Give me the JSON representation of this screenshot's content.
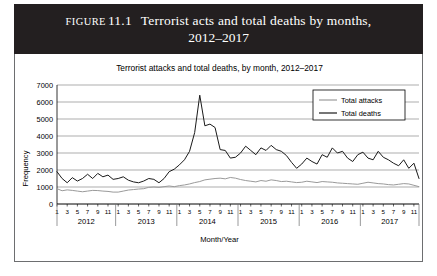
{
  "figure": {
    "label_word": "Figure",
    "number": "11.1",
    "title_line1": "Terrorist acts and total deaths by months,",
    "title_line2": "2012–2017",
    "banner_color": "#231f20",
    "banner_text_color": "#ffffff"
  },
  "chart_data": {
    "type": "line",
    "title": "Terrorist attacks and total deaths, by month, 2012–2017",
    "xlabel": "Month/Year",
    "ylabel": "Frequency",
    "ylim": [
      0,
      7000
    ],
    "ytick_step": 1000,
    "yticks": [
      "0",
      "1000",
      "2000",
      "3000",
      "4000",
      "5000",
      "6000",
      "7000"
    ],
    "grid": true,
    "legend_position": "top-right",
    "years": [
      "2012",
      "2013",
      "2014",
      "2015",
      "2016",
      "2017"
    ],
    "month_ticks": [
      "1",
      "3",
      "5",
      "7",
      "9",
      "11"
    ],
    "x_count": 72,
    "colors": {
      "total_attacks": "#9a9a9a",
      "total_deaths": "#1a1a1a"
    },
    "series": [
      {
        "name": "Total attacks",
        "color": "#9a9a9a",
        "values": [
          900,
          780,
          830,
          800,
          760,
          720,
          760,
          800,
          790,
          760,
          740,
          700,
          700,
          760,
          820,
          850,
          880,
          900,
          980,
          1000,
          980,
          1020,
          1060,
          1020,
          1080,
          1120,
          1180,
          1260,
          1320,
          1420,
          1460,
          1500,
          1520,
          1480,
          1560,
          1520,
          1440,
          1380,
          1340,
          1300,
          1380,
          1340,
          1420,
          1380,
          1320,
          1340,
          1300,
          1260,
          1280,
          1340,
          1300,
          1260,
          1320,
          1300,
          1280,
          1240,
          1220,
          1200,
          1180,
          1160,
          1220,
          1280,
          1240,
          1200,
          1180,
          1140,
          1120,
          1160,
          1200,
          1180,
          1100,
          1020
        ]
      },
      {
        "name": "Total deaths",
        "color": "#1a1a1a",
        "values": [
          1900,
          1500,
          1250,
          1550,
          1350,
          1500,
          1750,
          1500,
          1800,
          1600,
          1700,
          1450,
          1500,
          1600,
          1400,
          1300,
          1250,
          1350,
          1500,
          1450,
          1250,
          1500,
          1900,
          2050,
          2300,
          2600,
          3100,
          4200,
          6400,
          4600,
          4700,
          4500,
          3200,
          3150,
          2700,
          2750,
          3000,
          3400,
          3150,
          2900,
          3300,
          3150,
          3450,
          3200,
          3100,
          2850,
          2450,
          2100,
          2350,
          2700,
          2500,
          2350,
          2900,
          2750,
          3300,
          3000,
          3100,
          2700,
          2500,
          2900,
          3050,
          2700,
          2600,
          3100,
          2750,
          2600,
          2400,
          2250,
          2600,
          2100,
          2400,
          1500
        ]
      }
    ]
  },
  "legend": {
    "items": [
      {
        "label": "Total attacks",
        "color": "#9a9a9a"
      },
      {
        "label": "Total deaths",
        "color": "#1a1a1a"
      }
    ]
  }
}
